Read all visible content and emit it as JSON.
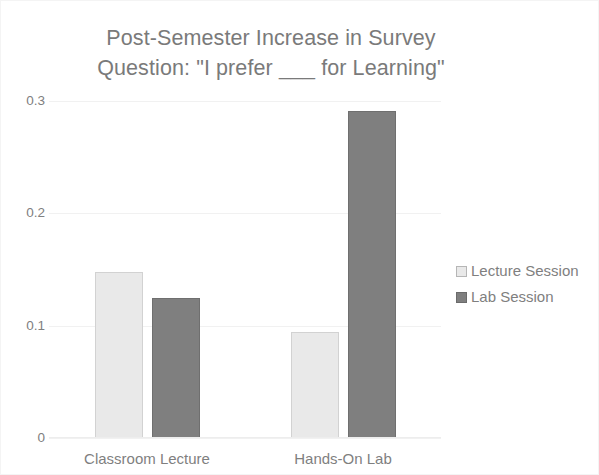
{
  "chart_data": {
    "type": "bar",
    "title": "Post-Semester Increase in Survey\nQuestion: \"I prefer ___ for Learning\"",
    "xlabel": "",
    "ylabel": "",
    "categories": [
      "Classroom Lecture",
      "Hands-On Lab"
    ],
    "series": [
      {
        "name": "Lecture Session",
        "values": [
          0.148,
          0.094
        ],
        "color": "#e9e9e9"
      },
      {
        "name": "Lab Session",
        "values": [
          0.125,
          0.291
        ],
        "color": "#7f7f7f"
      }
    ],
    "ylim": [
      0,
      0.3
    ],
    "yticks": [
      0,
      0.1,
      0.2,
      0.3
    ],
    "ytick_labels": [
      "0",
      "0.1",
      "0.2",
      "0.3"
    ],
    "grid": "horizontal",
    "legend_position": "right",
    "text_color": "#7f7f7f",
    "gridline_color": "#f1f1f1",
    "background": "#ffffff"
  }
}
